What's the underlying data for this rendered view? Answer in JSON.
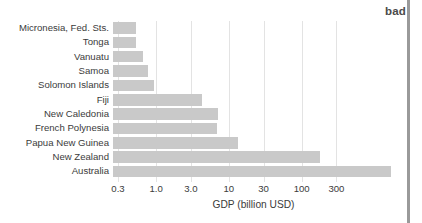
{
  "annotation": {
    "bad_label": "bad"
  },
  "chart_data": {
    "type": "bar",
    "orientation": "horizontal",
    "title": "",
    "subtitle": "",
    "xlabel": "GDP (billion USD)",
    "ylabel": "",
    "xscale": "log",
    "xlim": [
      0.3,
      600
    ],
    "xticks": [
      0.3,
      1.0,
      3.0,
      10,
      30,
      100,
      300
    ],
    "xtick_labels": [
      "0.3",
      "1.0",
      "3.0",
      "10",
      "30",
      "100",
      "300"
    ],
    "grid": "vertical",
    "legend": "none",
    "bar_color": "#c9c9c9",
    "annotations": [
      "bad"
    ],
    "categories": [
      "Micronesia, Fed. Sts.",
      "Tonga",
      "Vanuatu",
      "Samoa",
      "Solomon Islands",
      "Fiji",
      "New Caledonia",
      "French Polynesia",
      "Papua New Guinea",
      "New Zealand",
      "Australia"
    ],
    "values": [
      0.55,
      0.55,
      0.75,
      0.9,
      1.05,
      3.5,
      7.0,
      6.8,
      11,
      100,
      1400
    ],
    "bar_end_px": [
      136,
      136,
      143,
      148,
      154,
      202,
      218,
      217,
      238,
      320,
      391
    ]
  }
}
